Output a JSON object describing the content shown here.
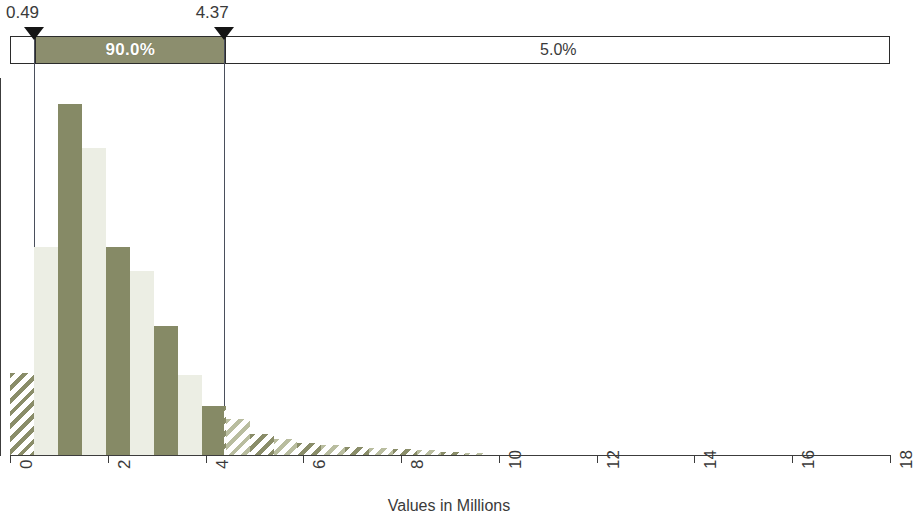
{
  "percentile_bar": {
    "segments": [
      {
        "label": "",
        "from": 0.0,
        "to": 0.49,
        "style": "empty"
      },
      {
        "label": "90.0%",
        "from": 0.49,
        "to": 4.37,
        "style": "filled"
      },
      {
        "label": "5.0%",
        "from": 4.37,
        "to": 18.0,
        "style": "empty"
      }
    ],
    "markers": [
      {
        "label": "0.49",
        "value": 0.49
      },
      {
        "label": "4.37",
        "value": 4.37
      }
    ],
    "fill_color": "#8c8e6e",
    "border_color": "#2b2b2b",
    "filled_label_color": "#ffffff",
    "label_color": "#3a3a3a"
  },
  "chart_data": {
    "type": "bar",
    "title": "",
    "subtitle": "",
    "xlabel": "Values in Millions",
    "ylabel": "",
    "xlim": [
      0,
      18
    ],
    "ylim": [
      0,
      1
    ],
    "grid": false,
    "legend": null,
    "xticks": [
      0,
      2,
      4,
      6,
      8,
      10,
      12,
      14,
      16,
      18
    ],
    "xticklabels": [
      "0",
      "2",
      "4",
      "6",
      "8",
      "10",
      "12",
      "14",
      "16",
      "18"
    ],
    "bin_width": 0.49,
    "bar_colors": {
      "dark": "#868a66",
      "light": "#eceee4"
    },
    "hatched_outside_interval": true,
    "interval": [
      0.49,
      4.37
    ],
    "bins": [
      {
        "x0": 0.0,
        "x1": 0.49,
        "height": 0.233,
        "shade": "dark",
        "hatched": true
      },
      {
        "x0": 0.49,
        "x1": 0.98,
        "height": 0.593,
        "shade": "light",
        "hatched": false
      },
      {
        "x0": 0.98,
        "x1": 1.47,
        "height": 1.0,
        "shade": "dark",
        "hatched": false
      },
      {
        "x0": 1.47,
        "x1": 1.96,
        "height": 0.875,
        "shade": "light",
        "hatched": false
      },
      {
        "x0": 1.96,
        "x1": 2.45,
        "height": 0.593,
        "shade": "dark",
        "hatched": false
      },
      {
        "x0": 2.45,
        "x1": 2.94,
        "height": 0.523,
        "shade": "light",
        "hatched": false
      },
      {
        "x0": 2.94,
        "x1": 3.43,
        "height": 0.368,
        "shade": "dark",
        "hatched": false
      },
      {
        "x0": 3.43,
        "x1": 3.92,
        "height": 0.228,
        "shade": "light",
        "hatched": false
      },
      {
        "x0": 3.92,
        "x1": 4.41,
        "height": 0.14,
        "shade": "dark",
        "hatched": false
      },
      {
        "x0": 4.41,
        "x1": 4.9,
        "height": 0.103,
        "shade": "light",
        "hatched": true
      },
      {
        "x0": 4.9,
        "x1": 5.39,
        "height": 0.06,
        "shade": "dark",
        "hatched": true
      },
      {
        "x0": 5.39,
        "x1": 5.88,
        "height": 0.046,
        "shade": "light",
        "hatched": true
      },
      {
        "x0": 5.88,
        "x1": 6.37,
        "height": 0.034,
        "shade": "dark",
        "hatched": true
      },
      {
        "x0": 6.37,
        "x1": 6.86,
        "height": 0.029,
        "shade": "light",
        "hatched": true
      },
      {
        "x0": 6.86,
        "x1": 7.35,
        "height": 0.022,
        "shade": "dark",
        "hatched": true
      },
      {
        "x0": 7.35,
        "x1": 7.84,
        "height": 0.02,
        "shade": "light",
        "hatched": true
      },
      {
        "x0": 7.84,
        "x1": 8.33,
        "height": 0.018,
        "shade": "dark",
        "hatched": true
      },
      {
        "x0": 8.33,
        "x1": 8.82,
        "height": 0.014,
        "shade": "light",
        "hatched": true
      },
      {
        "x0": 8.82,
        "x1": 9.31,
        "height": 0.01,
        "shade": "dark",
        "hatched": true
      },
      {
        "x0": 9.31,
        "x1": 9.8,
        "height": 0.006,
        "shade": "light",
        "hatched": true
      }
    ]
  }
}
